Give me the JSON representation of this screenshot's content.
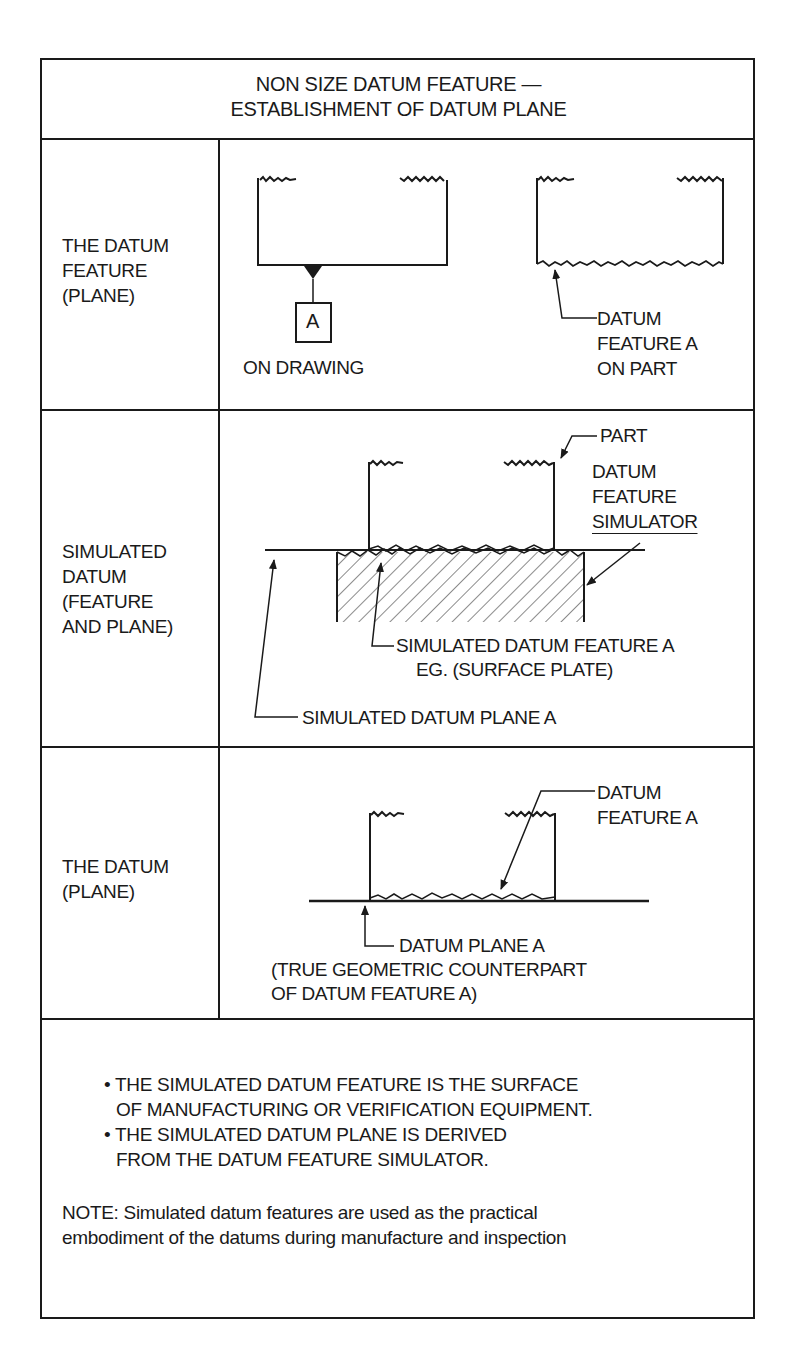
{
  "title": {
    "line1": "NON SIZE DATUM FEATURE —",
    "line2": "ESTABLISHMENT OF DATUM PLANE"
  },
  "rows": [
    {
      "label_lines": [
        "THE DATUM",
        "FEATURE",
        "(PLANE)"
      ],
      "labels": {
        "datum_symbol": "A",
        "on_drawing": "ON DRAWING",
        "on_part_lines": [
          "DATUM",
          "FEATURE A",
          "ON PART"
        ]
      }
    },
    {
      "label_lines": [
        "SIMULATED",
        "DATUM",
        "(FEATURE",
        "AND PLANE)"
      ],
      "labels": {
        "part": "PART",
        "simulator_lines": [
          "DATUM",
          "FEATURE",
          "SIMULATOR"
        ],
        "simulated_feature_line1": "SIMULATED DATUM FEATURE A",
        "simulated_feature_line2": "EG. (SURFACE PLATE)",
        "simulated_plane": "SIMULATED DATUM PLANE A"
      }
    },
    {
      "label_lines": [
        "THE DATUM",
        "(PLANE)"
      ],
      "labels": {
        "datum_feature_lines": [
          "DATUM",
          "FEATURE A"
        ],
        "datum_plane": "DATUM PLANE A",
        "counterpart_line1": "(TRUE GEOMETRIC COUNTERPART",
        "counterpart_line2": "OF DATUM FEATURE A)"
      }
    }
  ],
  "footer": {
    "bullets": [
      {
        "line1": "• THE SIMULATED DATUM FEATURE IS THE SURFACE",
        "line2": "OF MANUFACTURING OR VERIFICATION EQUIPMENT."
      },
      {
        "line1": "• THE SIMULATED DATUM PLANE IS DERIVED",
        "line2": "FROM THE DATUM FEATURE SIMULATOR."
      }
    ],
    "note_line1": "NOTE: Simulated datum features are used as the practical",
    "note_line2": "embodiment of the datums during manufacture and inspection"
  },
  "colors": {
    "ink": "#1a1a1a",
    "paper": "#ffffff"
  }
}
